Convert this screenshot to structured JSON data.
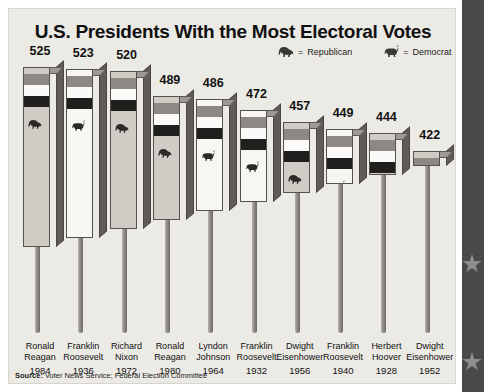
{
  "title": "U.S. Presidents With the Most Electoral Votes",
  "legend": {
    "republican": {
      "icon": "elephant-icon",
      "dash": "=",
      "label": "Republican",
      "color": "#3a3835"
    },
    "democrat": {
      "icon": "donkey-icon",
      "dash": "=",
      "label": "Democrat",
      "color": "#3a3835"
    }
  },
  "source": {
    "prefix": "Source:",
    "text": " Voter News Service; Federal Election Committee"
  },
  "colors": {
    "panel_background": "#eceae5",
    "page_background": "#ffffff",
    "band": "#4a4a4a",
    "star": "#8e8e8e",
    "stripe_gray": "#8c8984",
    "stripe_white": "#fbfaf8",
    "stripe_dark": "#201f1d",
    "republican_face": "#cfccc6",
    "democrat_face": "#f7f6f3",
    "text": "#111111"
  },
  "chart_data": {
    "type": "bar",
    "title": "U.S. Presidents With the Most Electoral Votes",
    "xlabel": "",
    "ylabel": "Electoral Votes",
    "ylim": [
      0,
      525
    ],
    "grid": false,
    "legend_position": "top-right",
    "categories": [
      "Ronald Reagan 1984",
      "Franklin Roosevelt 1936",
      "Richard Nixon 1972",
      "Ronald Reagan 1980",
      "Lyndon Johnson 1964",
      "Franklin Roosevelt 1932",
      "Dwight Eisenhower 1956",
      "Franklin Roosevelt 1940",
      "Herbert Hoover 1928",
      "Dwight Eisenhower 1952"
    ],
    "values": [
      525,
      523,
      520,
      489,
      486,
      472,
      457,
      449,
      444,
      422
    ],
    "bars": [
      {
        "value": "525",
        "first": "Ronald",
        "last": "Reagan",
        "year": "1984",
        "party": "Republican",
        "icon": "elephant-icon"
      },
      {
        "value": "523",
        "first": "Franklin",
        "last": "Roosevelt",
        "year": "1936",
        "party": "Democrat",
        "icon": "donkey-icon"
      },
      {
        "value": "520",
        "first": "Richard",
        "last": "Nixon",
        "year": "1972",
        "party": "Republican",
        "icon": "elephant-icon"
      },
      {
        "value": "489",
        "first": "Ronald",
        "last": "Reagan",
        "year": "1980",
        "party": "Republican",
        "icon": "elephant-icon"
      },
      {
        "value": "486",
        "first": "Lyndon",
        "last": "Johnson",
        "year": "1964",
        "party": "Democrat",
        "icon": "donkey-icon"
      },
      {
        "value": "472",
        "first": "Franklin",
        "last": "Roosevelt",
        "year": "1932",
        "party": "Democrat",
        "icon": "donkey-icon"
      },
      {
        "value": "457",
        "first": "Dwight",
        "last": "Eisenhower",
        "year": "1956",
        "party": "Republican",
        "icon": "elephant-icon"
      },
      {
        "value": "449",
        "first": "Franklin",
        "last": "Roosevelt",
        "year": "1940",
        "party": "Democrat",
        "icon": "donkey-icon"
      },
      {
        "value": "444",
        "first": "Herbert",
        "last": "Hoover",
        "year": "1928",
        "party": "Republican",
        "icon": "elephant-icon"
      },
      {
        "value": "422",
        "first": "Dwight",
        "last": "Eisenhower",
        "year": "1952",
        "party": "Republican",
        "icon": "elephant-icon"
      }
    ]
  }
}
